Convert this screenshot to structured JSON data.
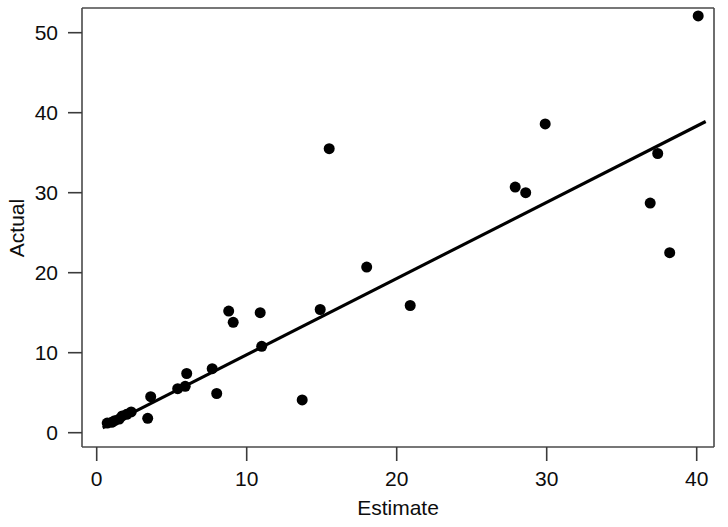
{
  "chart_data": {
    "type": "scatter",
    "title": "",
    "xlabel": "Estimate",
    "ylabel": "Actual",
    "xlim": [
      -1.0,
      41.5
    ],
    "ylim": [
      -1.5,
      53.5
    ],
    "xticks": [
      0,
      10,
      20,
      30,
      40
    ],
    "yticks": [
      0,
      10,
      20,
      30,
      40,
      50
    ],
    "xtick_labels": [
      "0",
      "10",
      "20",
      "30",
      "40"
    ],
    "ytick_labels": [
      "0",
      "10",
      "20",
      "30",
      "40",
      "50"
    ],
    "grid": false,
    "legend": null,
    "marker": "filled-circle",
    "marker_color": "#000000",
    "marker_size_px": 11,
    "points": [
      {
        "x": 0.7,
        "y": 1.2
      },
      {
        "x": 1.0,
        "y": 1.3
      },
      {
        "x": 1.2,
        "y": 1.5
      },
      {
        "x": 1.5,
        "y": 1.7
      },
      {
        "x": 1.7,
        "y": 2.1
      },
      {
        "x": 2.0,
        "y": 2.3
      },
      {
        "x": 2.3,
        "y": 2.6
      },
      {
        "x": 3.4,
        "y": 1.8
      },
      {
        "x": 3.6,
        "y": 4.5
      },
      {
        "x": 5.4,
        "y": 5.5
      },
      {
        "x": 5.9,
        "y": 5.8
      },
      {
        "x": 6.0,
        "y": 7.4
      },
      {
        "x": 7.7,
        "y": 8.0
      },
      {
        "x": 8.0,
        "y": 4.9
      },
      {
        "x": 8.8,
        "y": 15.2
      },
      {
        "x": 9.1,
        "y": 13.8
      },
      {
        "x": 10.9,
        "y": 15.0
      },
      {
        "x": 11.0,
        "y": 10.8
      },
      {
        "x": 13.7,
        "y": 4.1
      },
      {
        "x": 14.9,
        "y": 15.4
      },
      {
        "x": 15.5,
        "y": 35.5
      },
      {
        "x": 18.0,
        "y": 20.7
      },
      {
        "x": 20.9,
        "y": 15.9
      },
      {
        "x": 27.9,
        "y": 30.7
      },
      {
        "x": 28.6,
        "y": 30.0
      },
      {
        "x": 29.9,
        "y": 38.6
      },
      {
        "x": 36.9,
        "y": 28.7
      },
      {
        "x": 37.4,
        "y": 34.9
      },
      {
        "x": 38.2,
        "y": 22.5
      },
      {
        "x": 40.1,
        "y": 52.1
      }
    ],
    "fit_line": {
      "style": "solid",
      "color": "#000000",
      "x_start": 0.4,
      "y_start": 0.6,
      "x_end": 40.6,
      "y_end": 38.9
    }
  },
  "axes": {
    "y_title": "Actual",
    "x_title": "Estimate"
  }
}
